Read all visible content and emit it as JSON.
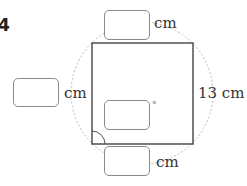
{
  "problem": {
    "number": "4"
  },
  "figure": {
    "shape": "square inscribed in dashed circle",
    "side_label": "13 cm",
    "colors": {
      "square_stroke": "#444444",
      "circle_stroke": "#bbbbbb",
      "box_border": "#8a8a8a"
    }
  },
  "answer_boxes": {
    "top": {
      "value": "",
      "unit": "cm"
    },
    "left": {
      "value": "",
      "unit": "cm"
    },
    "center": {
      "value": "",
      "unit": "°"
    },
    "bottom": {
      "value": "",
      "unit": "cm"
    }
  }
}
